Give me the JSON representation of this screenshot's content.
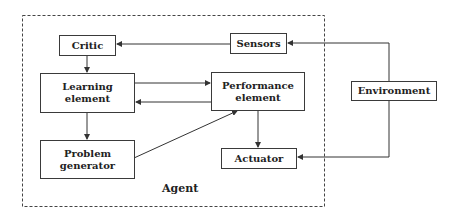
{
  "diagram": {
    "type": "agent-architecture",
    "container": {
      "label": "Agent",
      "style": "dashed"
    },
    "nodes": {
      "critic": {
        "label": "Critic"
      },
      "sensors": {
        "label": "Sensors"
      },
      "learning": {
        "label": "Learning\nelement"
      },
      "performance": {
        "label": "Performance\nelement"
      },
      "problem": {
        "label": "Problem\ngenerator"
      },
      "actuator": {
        "label": "Actuator"
      },
      "environment": {
        "label": "Environment"
      }
    },
    "edges": [
      {
        "from": "sensors",
        "to": "critic"
      },
      {
        "from": "environment",
        "to": "sensors"
      },
      {
        "from": "environment",
        "to": "actuator"
      },
      {
        "from": "critic",
        "to": "learning"
      },
      {
        "from": "learning",
        "to": "performance"
      },
      {
        "from": "performance",
        "to": "learning"
      },
      {
        "from": "learning",
        "to": "problem"
      },
      {
        "from": "problem",
        "to": "performance"
      },
      {
        "from": "performance",
        "to": "actuator"
      }
    ],
    "colors": {
      "line": "#333333",
      "background": "#ffffff",
      "text": "#222222"
    }
  }
}
